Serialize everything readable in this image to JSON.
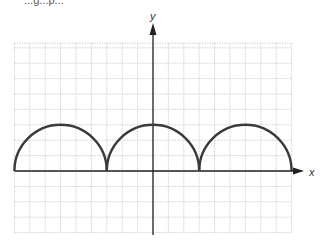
{
  "header": {
    "fragment_text": "...g...p..."
  },
  "chart_data": {
    "type": "line",
    "title": "",
    "xlabel": "x",
    "ylabel": "y",
    "grid": true,
    "grid_unit_px": 15.4,
    "origin_px": [
      153,
      171
    ],
    "xlim": [
      -9,
      9
    ],
    "ylim": [
      -4,
      8.3
    ],
    "series": [
      {
        "name": "semicircles",
        "description": "Three upper semicircles of radius 3 resting on the x-axis",
        "arcs": [
          {
            "center": [
              -6,
              0
            ],
            "radius": 3
          },
          {
            "center": [
              0,
              0
            ],
            "radius": 3
          },
          {
            "center": [
              6,
              0
            ],
            "radius": 3
          }
        ],
        "color": "#3a3a3a"
      }
    ],
    "annotations": []
  },
  "colors": {
    "grid": "#c8c8c8",
    "axis": "#222222",
    "curve": "#3a3a3a"
  }
}
